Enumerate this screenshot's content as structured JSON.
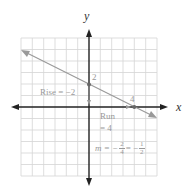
{
  "diagram": {
    "type": "coordinate-plane-line-slope",
    "axes": {
      "x_label": "x",
      "y_label": "y"
    },
    "grid": {
      "x_range": [
        -6,
        6
      ],
      "y_range": [
        -6,
        6
      ]
    },
    "line": {
      "points": [
        [
          0,
          2
        ],
        [
          4,
          0
        ]
      ],
      "color": "#999999"
    },
    "point_labels": {
      "y_intercept": "2",
      "x_intercept": "4"
    },
    "annotations": {
      "rise": "Rise = −2",
      "run_line1": "Run",
      "run_line2": "= 4",
      "slope_prefix": "m = −",
      "slope_frac1_num": "2",
      "slope_frac1_den": "4",
      "slope_mid": "= −",
      "slope_frac2_num": "1",
      "slope_frac2_den": "2"
    }
  }
}
